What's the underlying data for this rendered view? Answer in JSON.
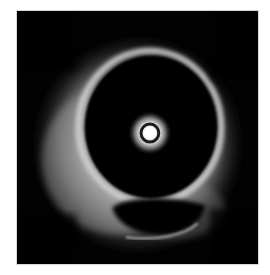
{
  "image": {
    "description": "Intravascular ultrasound (IVUS) cross-section of a vessel",
    "background_color": "#ffffff",
    "frame_color": "#030303",
    "structures": [
      {
        "name": "catheter",
        "label": "Catheter"
      },
      {
        "name": "lumen",
        "label": "Lumen"
      },
      {
        "name": "vessel-wall",
        "label": "Vessel wall"
      },
      {
        "name": "echolucent-region",
        "label": "Echolucent region"
      }
    ]
  }
}
